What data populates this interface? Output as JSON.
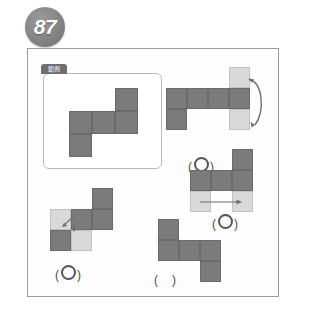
{
  "page": {
    "question_number": "87",
    "background_color": "#ffffff",
    "frame_border_color": "#9b9b9b"
  },
  "colors": {
    "dark_cell": "#7b7b7b",
    "light_cell": "#d9d9d9",
    "badge": "#7f7f7f",
    "answer_ink": "#4a4a4a"
  },
  "reference": {
    "tab_label": "範例",
    "panel_name": "reference-shape-panel",
    "grid": {
      "cell_size": 23,
      "cells": [
        {
          "row": 0,
          "col": 2,
          "fill": "dark"
        },
        {
          "row": 1,
          "col": 0,
          "fill": "dark"
        },
        {
          "row": 1,
          "col": 1,
          "fill": "dark"
        },
        {
          "row": 1,
          "col": 2,
          "fill": "dark"
        },
        {
          "row": 2,
          "col": 0,
          "fill": "dark"
        }
      ]
    }
  },
  "options": [
    {
      "id": "option-top-right",
      "grid": {
        "cell_size": 21,
        "cells": [
          {
            "row": 0,
            "col": 3,
            "fill": "light"
          },
          {
            "row": 1,
            "col": 0,
            "fill": "dark"
          },
          {
            "row": 1,
            "col": 1,
            "fill": "dark"
          },
          {
            "row": 1,
            "col": 2,
            "fill": "dark"
          },
          {
            "row": 1,
            "col": 3,
            "fill": "dark"
          },
          {
            "row": 2,
            "col": 0,
            "fill": "dark"
          },
          {
            "row": 2,
            "col": 3,
            "fill": "light"
          }
        ]
      },
      "arrow": {
        "type": "curved-down",
        "name": "move-arrow-curved"
      },
      "answer": {
        "marked": true,
        "text": "(",
        "mark": "circle",
        "close": ")"
      }
    },
    {
      "id": "option-middle-right",
      "grid": {
        "cell_size": 21,
        "cells": [
          {
            "row": 0,
            "col": 2,
            "fill": "dark"
          },
          {
            "row": 1,
            "col": 0,
            "fill": "dark"
          },
          {
            "row": 1,
            "col": 1,
            "fill": "dark"
          },
          {
            "row": 1,
            "col": 2,
            "fill": "dark"
          },
          {
            "row": 2,
            "col": 0,
            "fill": "light"
          },
          {
            "row": 2,
            "col": 2,
            "fill": "light"
          }
        ]
      },
      "arrow": {
        "type": "straight-right",
        "name": "move-arrow-horizontal"
      },
      "answer": {
        "marked": true,
        "text": "(",
        "mark": "circle",
        "close": ")"
      }
    },
    {
      "id": "option-bottom-left",
      "grid": {
        "cell_size": 21,
        "cells": [
          {
            "row": 0,
            "col": 2,
            "fill": "dark"
          },
          {
            "row": 1,
            "col": 0,
            "fill": "light"
          },
          {
            "row": 1,
            "col": 1,
            "fill": "dark"
          },
          {
            "row": 1,
            "col": 2,
            "fill": "dark"
          },
          {
            "row": 2,
            "col": 0,
            "fill": "dark"
          },
          {
            "row": 2,
            "col": 1,
            "fill": "light"
          }
        ]
      },
      "arrow": {
        "type": "diagonal-down-left",
        "name": "move-arrow-diagonal"
      },
      "answer": {
        "marked": true,
        "text": "(",
        "mark": "circle",
        "close": ")"
      }
    },
    {
      "id": "option-bottom-right",
      "grid": {
        "cell_size": 21,
        "cells": [
          {
            "row": 0,
            "col": 0,
            "fill": "dark"
          },
          {
            "row": 1,
            "col": 0,
            "fill": "dark"
          },
          {
            "row": 1,
            "col": 1,
            "fill": "dark"
          },
          {
            "row": 1,
            "col": 2,
            "fill": "dark"
          },
          {
            "row": 2,
            "col": 2,
            "fill": "dark"
          }
        ]
      },
      "arrow": null,
      "answer": {
        "marked": false,
        "text": "(",
        "mark": "blank",
        "close": ")"
      }
    }
  ]
}
